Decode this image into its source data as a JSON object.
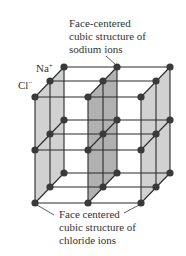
{
  "diagram": {
    "labels": {
      "sodium_structure": [
        "Face-centered",
        "cubic structure of",
        "sodium ions"
      ],
      "chloride_structure": [
        "Face centered",
        "cubic structure of",
        "chloride ions"
      ],
      "na_ion": {
        "symbol": "Na",
        "charge": "+"
      },
      "cl_ion": {
        "symbol": "Cl",
        "charge": "−"
      }
    },
    "colors": {
      "node": "#3a3a3a",
      "line": "#2a2a2a",
      "side_plane": "#c9c9c9",
      "middle_plane": "#a3a3a3",
      "text": "#333333"
    },
    "lattice": {
      "columns_x_front": [
        35,
        88,
        141
      ],
      "depth_offset": [
        0,
        [
          15,
          -16
        ],
        [
          29,
          -30
        ]
      ],
      "levels_y_front": [
        97,
        150,
        203
      ]
    }
  }
}
